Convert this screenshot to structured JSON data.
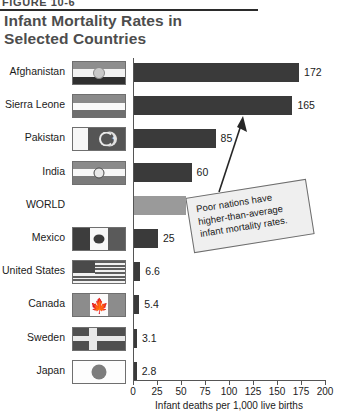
{
  "figure": {
    "label": "FIGURE 10-6",
    "title_line1": "Infant Mortality Rates in",
    "title_line2": "Selected Countries"
  },
  "callout": {
    "text": "Poor nations have higher-than-average infant mortality rates."
  },
  "chart_data": {
    "type": "bar",
    "orientation": "horizontal",
    "title": "Infant Mortality Rates in Selected Countries",
    "xlabel": "Infant deaths per 1,000 live births",
    "ylabel": "",
    "xlim": [
      0,
      200
    ],
    "xticks": [
      0,
      25,
      50,
      75,
      100,
      125,
      150,
      175,
      200
    ],
    "grid": false,
    "legend": "none",
    "annotations": [
      "Poor nations have higher-than-average infant mortality rates."
    ],
    "categories": [
      "Afghanistan",
      "Sierra Leone",
      "Pakistan",
      "India",
      "WORLD",
      "Mexico",
      "United States",
      "Canada",
      "Sweden",
      "Japan"
    ],
    "values": [
      172,
      165,
      85,
      60,
      54,
      25,
      6.6,
      5.4,
      3.1,
      2.8
    ],
    "value_labels": [
      "172",
      "165",
      "85",
      "60",
      "54",
      "25",
      "6.6",
      "5.4",
      "3.1",
      "2.8"
    ],
    "highlight_category": "WORLD",
    "colors": {
      "bar": "#3a3a3a",
      "bar_highlight": "#9a9a9a",
      "axis": "#555555",
      "title": "#4d4d4d",
      "text": "#1b1b1b",
      "callout_fill": "#efefef"
    }
  },
  "rows": [
    {
      "country": "Afghanistan",
      "value": 172,
      "label": "172",
      "flag": "flag-afghanistan",
      "highlight": false
    },
    {
      "country": "Sierra Leone",
      "value": 165,
      "label": "165",
      "flag": "flag-sierra-leone",
      "highlight": false
    },
    {
      "country": "Pakistan",
      "value": 85,
      "label": "85",
      "flag": "flag-pakistan",
      "highlight": false
    },
    {
      "country": "India",
      "value": 60,
      "label": "60",
      "flag": "flag-india",
      "highlight": false
    },
    {
      "country": "WORLD",
      "value": 54,
      "label": "54",
      "flag": "none",
      "highlight": true
    },
    {
      "country": "Mexico",
      "value": 25,
      "label": "25",
      "flag": "flag-mexico",
      "highlight": false
    },
    {
      "country": "United States",
      "value": 6.6,
      "label": "6.6",
      "flag": "flag-united-states",
      "highlight": false
    },
    {
      "country": "Canada",
      "value": 5.4,
      "label": "5.4",
      "flag": "flag-canada",
      "highlight": false
    },
    {
      "country": "Sweden",
      "value": 3.1,
      "label": "3.1",
      "flag": "flag-sweden",
      "highlight": false
    },
    {
      "country": "Japan",
      "value": 2.8,
      "label": "2.8",
      "flag": "flag-japan",
      "highlight": false
    }
  ],
  "axis": {
    "caption": "Infant deaths per 1,000 live births",
    "ticks": [
      "0",
      "25",
      "50",
      "75",
      "100",
      "125",
      "150",
      "175",
      "200"
    ]
  }
}
